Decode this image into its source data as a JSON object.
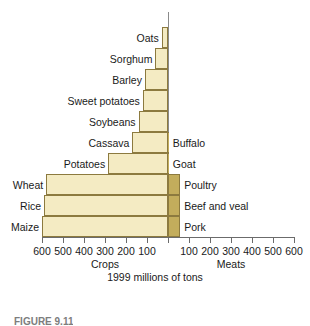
{
  "chart_data": {
    "type": "bar",
    "orientation": "horizontal-diverging",
    "title": "",
    "subtitle": "",
    "xlabel": "1999 millions of tons",
    "ylabel": "",
    "left_axis_label": "Crops",
    "right_axis_label": "Meats",
    "units_caption": "1999 millions of tons",
    "grid": false,
    "legend": "none",
    "axis_zero_at_center": true,
    "left_xlim": [
      0,
      600
    ],
    "right_xlim": [
      0,
      600
    ],
    "left_ticks": [
      600,
      500,
      400,
      300,
      200,
      100
    ],
    "right_ticks": [
      100,
      200,
      300,
      400,
      500,
      600
    ],
    "tick_step": 100,
    "left_series": {
      "name": "Crops",
      "color": "#f4ebc3",
      "categories": [
        "Oats",
        "Sorghum",
        "Barley",
        "Sweet potatoes",
        "Soybeans",
        "Cassava",
        "Potatoes",
        "Wheat",
        "Rice",
        "Maize"
      ],
      "values": [
        30,
        60,
        110,
        120,
        140,
        170,
        285,
        580,
        590,
        600
      ]
    },
    "right_series": {
      "name": "Meats",
      "color": "#c3ad5c",
      "categories": [
        "",
        "",
        "",
        "",
        "",
        "Buffalo",
        "Goat",
        "Poultry",
        "Beef and veal",
        "Pork"
      ],
      "values": [
        0,
        0,
        0,
        0,
        0,
        3,
        4,
        58,
        58,
        58
      ]
    },
    "rows": [
      {
        "crop_label": "Oats",
        "crop_value": 30,
        "meat_label": "",
        "meat_value": 0
      },
      {
        "crop_label": "Sorghum",
        "crop_value": 60,
        "meat_label": "",
        "meat_value": 0
      },
      {
        "crop_label": "Barley",
        "crop_value": 110,
        "meat_label": "",
        "meat_value": 0
      },
      {
        "crop_label": "Sweet potatoes",
        "crop_value": 120,
        "meat_label": "",
        "meat_value": 0
      },
      {
        "crop_label": "Soybeans",
        "crop_value": 140,
        "meat_label": "",
        "meat_value": 0
      },
      {
        "crop_label": "Cassava",
        "crop_value": 170,
        "meat_label": "Buffalo",
        "meat_value": 3
      },
      {
        "crop_label": "Potatoes",
        "crop_value": 285,
        "meat_label": "Goat",
        "meat_value": 4
      },
      {
        "crop_label": "Wheat",
        "crop_value": 580,
        "meat_label": "Poultry",
        "meat_value": 58
      },
      {
        "crop_label": "Rice",
        "crop_value": 590,
        "meat_label": "Beef and veal",
        "meat_value": 58
      },
      {
        "crop_label": "Maize",
        "crop_value": 600,
        "meat_label": "Pork",
        "meat_value": 58
      }
    ]
  },
  "colors": {
    "crop_fill": "#f4ebc3",
    "meat_fill": "#c3ad5c",
    "bar_stroke": "#8c7a3f",
    "axis": "#6b6b6b",
    "text": "#1a1a1a",
    "caption": "#7d7d7d",
    "background": "#ffffff"
  },
  "figure_caption": "FIGURE 9.11"
}
